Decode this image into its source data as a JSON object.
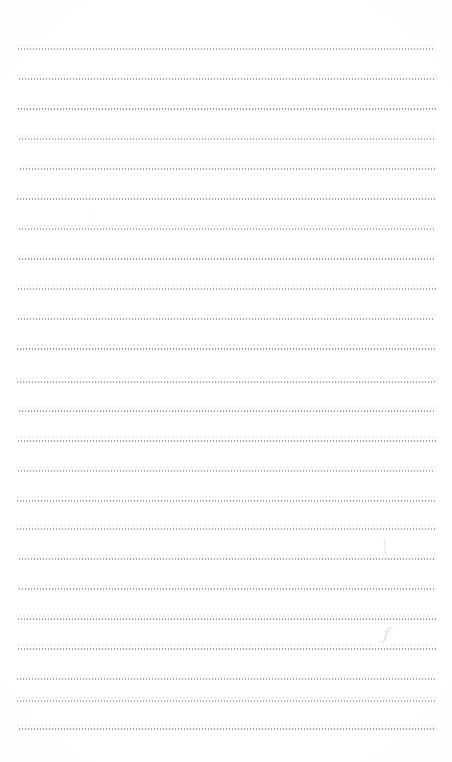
{
  "page": {
    "kind": "scanned-blank-ruled-notebook-page",
    "width": 452,
    "height": 762,
    "background_color": "#ffffff",
    "content_text": "",
    "has_typed_text": false,
    "has_headers": false,
    "has_page_number": false
  },
  "ruling": {
    "line_color": "#787884",
    "line_style": "dotted-dashed faint scan",
    "line_count": 23,
    "first_line_y": 48,
    "line_spacing": 30,
    "left_x": 17,
    "right_x": 436,
    "lines": [
      {
        "y": 48,
        "left": 18,
        "right": 434,
        "opacity": 0.72
      },
      {
        "y": 78,
        "left": 17,
        "right": 436,
        "opacity": 0.82
      },
      {
        "y": 108,
        "left": 17,
        "right": 436,
        "opacity": 0.86
      },
      {
        "y": 138,
        "left": 18,
        "right": 435,
        "opacity": 0.74
      },
      {
        "y": 168,
        "left": 20,
        "right": 435,
        "opacity": 0.8
      },
      {
        "y": 198,
        "left": 17,
        "right": 436,
        "opacity": 0.84
      },
      {
        "y": 228,
        "left": 17,
        "right": 434,
        "opacity": 0.7
      },
      {
        "y": 258,
        "left": 17,
        "right": 436,
        "opacity": 0.88
      },
      {
        "y": 288,
        "left": 17,
        "right": 436,
        "opacity": 0.78
      },
      {
        "y": 318,
        "left": 17,
        "right": 435,
        "opacity": 0.82
      },
      {
        "y": 348,
        "left": 17,
        "right": 436,
        "opacity": 0.9
      },
      {
        "y": 381,
        "left": 17,
        "right": 436,
        "opacity": 0.76
      },
      {
        "y": 410,
        "left": 17,
        "right": 436,
        "opacity": 0.8
      },
      {
        "y": 440,
        "left": 17,
        "right": 436,
        "opacity": 0.84
      },
      {
        "y": 470,
        "left": 17,
        "right": 435,
        "opacity": 0.72
      },
      {
        "y": 500,
        "left": 17,
        "right": 436,
        "opacity": 0.8
      },
      {
        "y": 528,
        "left": 17,
        "right": 436,
        "opacity": 0.74
      },
      {
        "y": 558,
        "left": 17,
        "right": 436,
        "opacity": 0.82
      },
      {
        "y": 588,
        "left": 17,
        "right": 436,
        "opacity": 0.76
      },
      {
        "y": 618,
        "left": 17,
        "right": 436,
        "opacity": 0.8
      },
      {
        "y": 648,
        "left": 17,
        "right": 436,
        "opacity": 0.84
      },
      {
        "y": 678,
        "left": 17,
        "right": 436,
        "opacity": 0.74
      },
      {
        "y": 700,
        "left": 17,
        "right": 436,
        "opacity": 0.7
      },
      {
        "y": 728,
        "left": 17,
        "right": 436,
        "opacity": 0.86
      }
    ]
  },
  "marks": [
    {
      "id": "mark-upper-left",
      "glyph": "′",
      "x": 92,
      "y": 214,
      "size": 11,
      "rotate": -8,
      "opacity": 0.45
    },
    {
      "id": "mark-mid-right",
      "glyph": "│",
      "x": 381,
      "y": 540,
      "size": 13,
      "rotate": -4,
      "opacity": 0.4
    },
    {
      "id": "mark-lower-right",
      "glyph": "ƒ",
      "x": 383,
      "y": 626,
      "size": 17,
      "rotate": 6,
      "opacity": 0.48
    }
  ]
}
